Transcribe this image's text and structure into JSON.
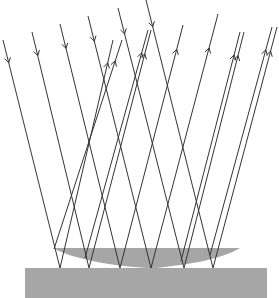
{
  "diagram": {
    "type": "ray-reflection",
    "colors": {
      "background": "#ffffff",
      "ray": "#333333",
      "material": "#a6a6a6"
    },
    "substrate": {
      "x": 25,
      "y": 268,
      "width": 242,
      "height": 30
    },
    "film": {
      "left_x": 53,
      "right_x": 240,
      "top_y": 248,
      "contact_x": 151,
      "contact_y": 268
    },
    "incident_rays": [
      {
        "from": [
          3,
          40
        ],
        "to": [
          60,
          268
        ]
      },
      {
        "from": [
          32,
          32
        ],
        "to": [
          89,
          268
        ]
      },
      {
        "from": [
          60,
          24
        ],
        "to": [
          120,
          268
        ]
      },
      {
        "from": [
          88,
          16
        ],
        "to": [
          151,
          268
        ]
      },
      {
        "from": [
          118,
          8
        ],
        "to": [
          184,
          268
        ]
      },
      {
        "from": [
          146,
          0
        ],
        "to": [
          213,
          268
        ]
      }
    ],
    "reflected_rays": [
      {
        "from": [
          60,
          268
        ],
        "to": [
          113,
          40
        ]
      },
      {
        "from": [
          54,
          249
        ],
        "to": [
          122,
          40
        ]
      },
      {
        "from": [
          89,
          268
        ],
        "to": [
          151,
          30
        ]
      },
      {
        "from": [
          85,
          258
        ],
        "to": [
          148,
          30
        ]
      },
      {
        "from": [
          120,
          268
        ],
        "to": [
          183,
          25
        ]
      },
      {
        "from": [
          151,
          268
        ],
        "to": [
          218,
          14
        ]
      },
      {
        "from": [
          184,
          268
        ],
        "to": [
          244,
          32
        ]
      },
      {
        "from": [
          181,
          261
        ],
        "to": [
          240,
          32
        ]
      },
      {
        "from": [
          213,
          268
        ],
        "to": [
          277,
          27
        ]
      },
      {
        "from": [
          210,
          255
        ],
        "to": [
          272,
          27
        ]
      }
    ]
  }
}
